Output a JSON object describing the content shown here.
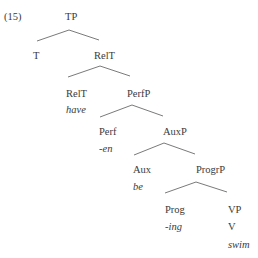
{
  "example_number": "(15)",
  "tree": {
    "root": {
      "label": "TP"
    },
    "nodes": [
      {
        "id": "T",
        "label": "T"
      },
      {
        "id": "RelT",
        "label": "RelT"
      },
      {
        "id": "RelT_head",
        "label": "RelT",
        "word": "have"
      },
      {
        "id": "PerfP",
        "label": "PerfP"
      },
      {
        "id": "Perf",
        "label": "Perf",
        "word": "-en"
      },
      {
        "id": "AuxP",
        "label": "AuxP"
      },
      {
        "id": "Aux",
        "label": "Aux",
        "word": "be"
      },
      {
        "id": "ProgrP",
        "label": "ProgrP"
      },
      {
        "id": "Prog",
        "label": "Prog",
        "word": "-ing"
      },
      {
        "id": "VP",
        "label": "VP",
        "child": "V",
        "word": "swim"
      }
    ]
  },
  "line_color": "#7a7a7a"
}
